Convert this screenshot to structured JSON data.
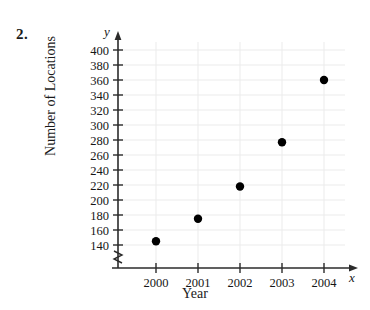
{
  "problem": {
    "number": "2."
  },
  "chart_data": {
    "type": "scatter",
    "title": "",
    "xlabel": "Year",
    "ylabel": "Number of Locations",
    "x_axis_variable": "x",
    "y_axis_variable": "y",
    "categories": [
      "2000",
      "2001",
      "2002",
      "2003",
      "2004"
    ],
    "x": [
      2000,
      2001,
      2002,
      2003,
      2004
    ],
    "values": [
      145,
      175,
      218,
      277,
      360
    ],
    "series": [
      {
        "name": "Number of Locations",
        "points": [
          {
            "x": "2000",
            "y": 145
          },
          {
            "x": "2001",
            "y": 175
          },
          {
            "x": "2002",
            "y": 218
          },
          {
            "x": "2003",
            "y": 277
          },
          {
            "x": "2004",
            "y": 360
          }
        ]
      }
    ],
    "xlim": [
      2000,
      2004
    ],
    "ylim": [
      140,
      400
    ],
    "y_ticks": [
      140,
      160,
      180,
      200,
      220,
      240,
      260,
      280,
      300,
      320,
      340,
      360,
      380,
      400
    ],
    "x_ticks": [
      "2000",
      "2001",
      "2002",
      "2003",
      "2004"
    ],
    "y_tick_labels": [
      "400",
      "380",
      "360",
      "340",
      "320",
      "300",
      "280",
      "260",
      "240",
      "220",
      "200",
      "180",
      "160",
      "140"
    ],
    "grid": true,
    "grid_color": "#ebebeb",
    "axis_break": true,
    "legend": "none",
    "marker_color": "#000000",
    "axis_color": "#2b2b2b"
  }
}
